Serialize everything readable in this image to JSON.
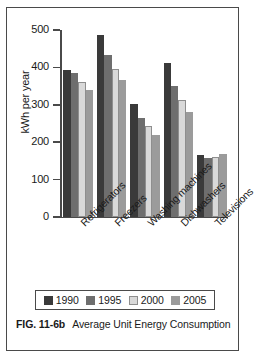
{
  "figure": {
    "number_label": "FIG. 11-6b",
    "caption_text": "Average Unit Energy Consumption"
  },
  "legend": {
    "position": "bottom",
    "entries": [
      {
        "label": "1990",
        "color": "#3a3a3a"
      },
      {
        "label": "1995",
        "color": "#6e6e6e"
      },
      {
        "label": "2000",
        "color": "#d9d9d9"
      },
      {
        "label": "2005",
        "color": "#9b9b9b"
      }
    ]
  },
  "axes": {
    "y_title": "kWh per year",
    "y_ticks": [
      "500",
      "400",
      "300",
      "200",
      "100",
      "0"
    ],
    "x_title": ""
  },
  "chart_data": {
    "type": "bar",
    "title": "Average Unit Energy Consumption",
    "xlabel": "",
    "ylabel": "kWh per year",
    "ylim": [
      0,
      500
    ],
    "ytick_values": [
      0,
      100,
      200,
      300,
      400,
      500
    ],
    "grid": false,
    "legend_position": "bottom",
    "categories": [
      "Refrigerators",
      "Freezers",
      "Washing machines",
      "Dishwashers",
      "Televisions"
    ],
    "series": [
      {
        "name": "1990",
        "color": "#3a3a3a",
        "values": [
          392,
          487,
          302,
          411,
          166
        ]
      },
      {
        "name": "1995",
        "color": "#6e6e6e",
        "values": [
          384,
          434,
          264,
          349,
          158
        ]
      },
      {
        "name": "2000",
        "color": "#d9d9d9",
        "values": [
          361,
          396,
          243,
          313,
          160
        ]
      },
      {
        "name": "2005",
        "color": "#9b9b9b",
        "values": [
          340,
          367,
          220,
          281,
          169
        ]
      }
    ]
  }
}
